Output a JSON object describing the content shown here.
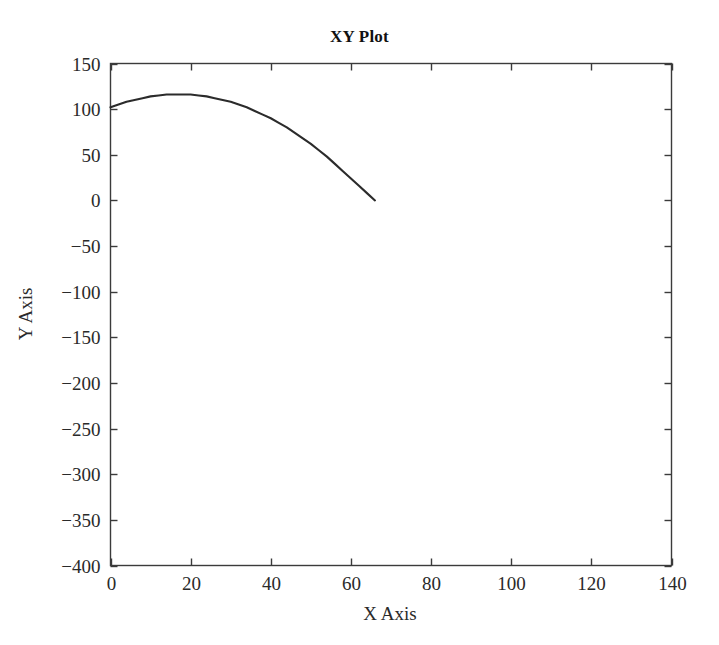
{
  "chart_data": {
    "type": "line",
    "title": "XY Plot",
    "xlabel": "X Axis",
    "ylabel": "Y Axis",
    "xlim": [
      0,
      140
    ],
    "ylim": [
      -400,
      150
    ],
    "xticks": [
      0,
      20,
      40,
      60,
      80,
      100,
      120,
      140
    ],
    "yticks": [
      150,
      100,
      50,
      0,
      -50,
      -100,
      -150,
      -200,
      -250,
      -300,
      -350,
      -400
    ],
    "xtick_labels": [
      "0",
      "20",
      "40",
      "60",
      "80",
      "100",
      "120",
      "140"
    ],
    "ytick_labels": [
      "150",
      "100",
      "50",
      "0",
      "−50",
      "−100",
      "−150",
      "−200",
      "−250",
      "−300",
      "−350",
      "−400"
    ],
    "grid": false,
    "legend": null,
    "background": "#ffffff",
    "series": [
      {
        "name": "trajectory",
        "color": "#2b2b2b",
        "x": [
          0,
          2,
          4,
          6,
          8,
          10,
          12,
          14,
          16,
          18,
          20,
          22,
          24,
          26,
          28,
          30,
          32,
          34,
          36,
          38,
          40,
          42,
          44,
          46,
          48,
          50,
          52,
          54,
          56,
          58,
          60,
          62,
          64,
          66
        ],
        "y": [
          102,
          105,
          108,
          110,
          112,
          114,
          115,
          116,
          116,
          116,
          116,
          115,
          114,
          112,
          110,
          108,
          105,
          102,
          98,
          94,
          90,
          85,
          80,
          74,
          68,
          62,
          55,
          48,
          40,
          32,
          24,
          16,
          8,
          0
        ]
      }
    ]
  }
}
